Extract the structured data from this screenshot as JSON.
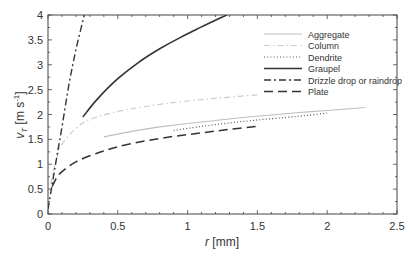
{
  "chart_data": {
    "type": "line",
    "title": "",
    "xlabel": "r [mm]",
    "ylabel": "vT [m s-1]",
    "xlim": [
      0,
      2.5
    ],
    "ylim": [
      0,
      4
    ],
    "xticks": [
      "0",
      "0.5",
      "1",
      "1.5",
      "2",
      "2.5"
    ],
    "yticks": [
      "0",
      "0.5",
      "1",
      "1.5",
      "2",
      "2.5",
      "3",
      "3.5",
      "4"
    ],
    "grid": false,
    "legend_position": "upper right",
    "series": [
      {
        "name": "Aggregate",
        "style": "solid-light",
        "color": "#bbbbbb",
        "x": [
          0.4,
          0.6,
          0.8,
          1.0,
          1.2,
          1.4,
          1.6,
          1.8,
          2.0,
          2.27
        ],
        "y": [
          1.55,
          1.66,
          1.75,
          1.82,
          1.88,
          1.94,
          1.99,
          2.04,
          2.08,
          2.14
        ]
      },
      {
        "name": "Column",
        "style": "dashdot-light",
        "color": "#c8c8c8",
        "x": [
          0.02,
          0.05,
          0.1,
          0.2,
          0.3,
          0.5,
          0.7,
          0.9,
          1.1,
          1.3,
          1.52
        ],
        "y": [
          0.6,
          1.0,
          1.4,
          1.72,
          1.9,
          2.06,
          2.16,
          2.24,
          2.3,
          2.35,
          2.4
        ]
      },
      {
        "name": "Dendrite",
        "style": "dotted",
        "color": "#555555",
        "x": [
          0.9,
          1.1,
          1.3,
          1.5,
          1.7,
          1.85,
          2.0
        ],
        "y": [
          1.68,
          1.76,
          1.83,
          1.89,
          1.94,
          1.98,
          2.03
        ]
      },
      {
        "name": "Graupel",
        "style": "solid-dark",
        "color": "#333333",
        "x": [
          0.25,
          0.35,
          0.5,
          0.65,
          0.8,
          0.95,
          1.1,
          1.28
        ],
        "y": [
          1.95,
          2.3,
          2.72,
          3.05,
          3.32,
          3.55,
          3.76,
          4.0
        ]
      },
      {
        "name": "Drizzle drop or raindrop",
        "style": "dashdot-dark",
        "color": "#333333",
        "x": [
          0.0,
          0.03,
          0.06,
          0.1,
          0.15,
          0.2,
          0.26
        ],
        "y": [
          0.1,
          0.6,
          1.1,
          1.75,
          2.6,
          3.3,
          4.0
        ]
      },
      {
        "name": "Plate",
        "style": "dashed",
        "color": "#333333",
        "x": [
          0.03,
          0.06,
          0.1,
          0.2,
          0.35,
          0.5,
          0.7,
          0.9,
          1.1,
          1.3,
          1.5
        ],
        "y": [
          0.55,
          0.72,
          0.85,
          1.05,
          1.22,
          1.35,
          1.47,
          1.56,
          1.63,
          1.7,
          1.76
        ]
      }
    ]
  },
  "axes": {
    "xlabel_italic": "r",
    "xlabel_unit": " [mm]",
    "ylabel_v": "v",
    "ylabel_sub": "T",
    "ylabel_unit": " [m s",
    "ylabel_exp": "-1",
    "ylabel_close": "]"
  },
  "legend": {
    "items": [
      "Aggregate",
      "Column",
      "Dendrite",
      "Graupel",
      "Drizzle drop or raindrop",
      "Plate"
    ]
  }
}
